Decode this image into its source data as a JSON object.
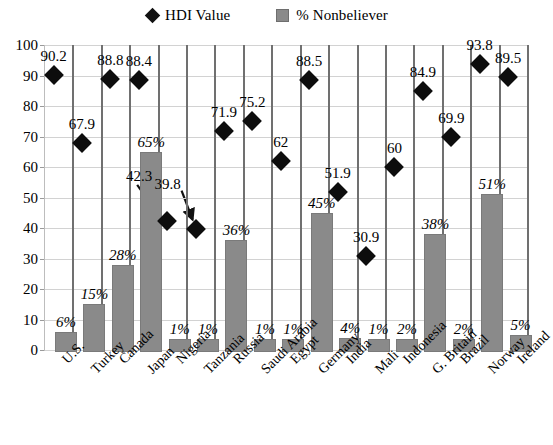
{
  "legend": {
    "entries": [
      {
        "icon": "diamond-marker-icon",
        "label": "HDI Value"
      },
      {
        "icon": "square-marker-icon",
        "label": "% Nonbeliever"
      }
    ]
  },
  "axis": {
    "y_ticks": [
      "100",
      "90",
      "80",
      "70",
      "60",
      "50",
      "40",
      "30",
      "20",
      "10",
      "0"
    ]
  },
  "colors": {
    "diamond": "#0d0d0d",
    "bar": "#8a8a8a",
    "grid": "#d2d2d2",
    "separator": "#707070"
  },
  "chart_data": {
    "type": "bar",
    "title": "",
    "xlabel": "",
    "ylabel": "",
    "ylim": [
      0,
      100
    ],
    "grid": true,
    "legend_position": "top-center",
    "categories": [
      "U.S.",
      "Turkey",
      "Canada",
      "Japan",
      "Nigeria",
      "Tanzania",
      "Russia",
      "Saudi Arabia",
      "Egypt",
      "Germany",
      "India",
      "Mali",
      "Indonesia",
      "G. Britain",
      "Brazil",
      "Norway",
      "Ireland"
    ],
    "series": [
      {
        "name": "HDI Value",
        "type": "scatter",
        "marker": "diamond",
        "values": [
          90.2,
          67.9,
          88.8,
          88.4,
          42.3,
          39.8,
          71.9,
          75.2,
          62,
          88.5,
          51.9,
          30.9,
          60,
          84.9,
          69.9,
          93.8,
          89.5
        ],
        "labels": [
          "90.2",
          "67.9",
          "88.8",
          "88.4",
          "42.3",
          "39.8",
          "71.9",
          "75.2",
          "62",
          "88.5",
          "51.9",
          "30.9",
          "60",
          "84.9",
          "69.9",
          "93.8",
          "89.5"
        ]
      },
      {
        "name": "% Nonbeliever",
        "type": "bar",
        "values": [
          6,
          15,
          28,
          65,
          1,
          1,
          36,
          1,
          1,
          45,
          4,
          1,
          2,
          38,
          2,
          51,
          5
        ],
        "labels": [
          "6%",
          "15%",
          "28%",
          "65%",
          "1%",
          "1%",
          "36%",
          "1%",
          "1%",
          "45%",
          "4%",
          "1%",
          "2%",
          "38%",
          "2%",
          "51%",
          "5%"
        ]
      }
    ],
    "annotations": [
      {
        "text": "42.3",
        "points_to": "Nigeria HDI marker",
        "arrow": true
      },
      {
        "text": "39.8",
        "points_to": "Tanzania HDI marker",
        "arrow": true
      }
    ]
  }
}
